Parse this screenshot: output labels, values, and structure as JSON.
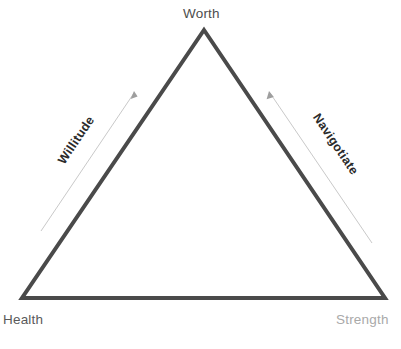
{
  "diagram": {
    "type": "triangle",
    "background_color": "#ffffff",
    "stroke_color": "#4a4a4a",
    "stroke_width": 4,
    "vertices": [
      {
        "name": "apex",
        "label": "Worth",
        "x": 204,
        "y": 30,
        "color": "#4d4d4d"
      },
      {
        "name": "bottom-left",
        "label": "Health",
        "x": 22,
        "y": 298,
        "color": "#5a5a5a"
      },
      {
        "name": "bottom-right",
        "label": "Strength",
        "x": 385,
        "y": 298,
        "color": "#a9a9a9"
      }
    ],
    "edges": [
      {
        "name": "left-edge",
        "label": "Willitude",
        "rotation_deg": -56,
        "arrow": {
          "name": "left-arrow",
          "color": "#c9c9c9",
          "direction": "up-toward-apex",
          "x1": 41,
          "y1": 231,
          "x2": 134,
          "y2": 93
        }
      },
      {
        "name": "right-edge",
        "label": "Navigotiate",
        "rotation_deg": 56,
        "arrow": {
          "name": "right-arrow",
          "color": "#c9c9c9",
          "direction": "up-toward-apex",
          "x1": 372,
          "y1": 243,
          "x2": 270,
          "y2": 93
        }
      }
    ],
    "caption": ""
  }
}
